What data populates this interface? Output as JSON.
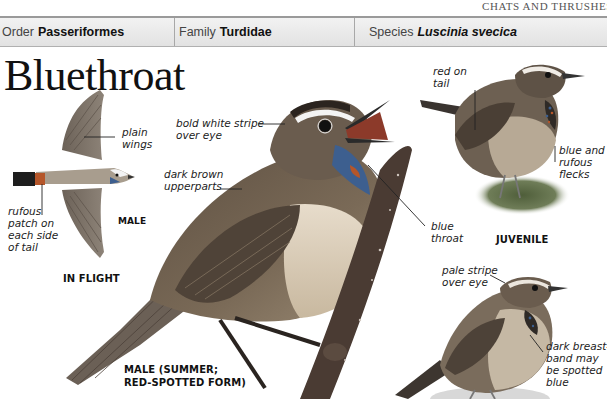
{
  "running_head": "Chats and Thrushes",
  "taxonomy": {
    "order": {
      "label": "Order",
      "value": "Passeriformes"
    },
    "family": {
      "label": "Family",
      "value": "Turdidae"
    },
    "species": {
      "label": "Species",
      "value": "Luscinia svecica"
    }
  },
  "title": "Bluethroat",
  "illustrations": {
    "in_flight": {
      "caption": "IN FLIGHT",
      "sex_label": "MALE",
      "notes": {
        "wings": "plain\nwings",
        "tail": "rufous\npatch on\neach side\nof tail"
      }
    },
    "male_summer": {
      "caption_line1": "MALE (SUMMER;",
      "caption_line2": "RED-SPOTTED FORM)",
      "notes": {
        "eye_line1": "bold white stripe",
        "eye_line2": "over eye",
        "upper_line1": "dark brown",
        "upper_line2": "upperparts",
        "throat_line1": "blue",
        "throat_line2": "throat"
      }
    },
    "juvenile": {
      "caption": "JUVENILE",
      "notes": {
        "tail_line1": "red on",
        "tail_line2": "tail",
        "flecks_line1": "blue and",
        "flecks_line2": "rufous",
        "flecks_line3": "flecks"
      }
    },
    "female": {
      "notes": {
        "eye_line1": "pale stripe",
        "eye_line2": "over eye",
        "breast_line1": "dark breast-",
        "breast_line2": "band may",
        "breast_line3": "be spotted",
        "breast_line4": "blue"
      }
    }
  },
  "colors": {
    "header_bar": "#e6e6e6",
    "header_border": "#9a9a9a",
    "bird_brown": "#6b5a48",
    "bird_belly": "#d9cbb4",
    "throat_blue": "#3d5f8f",
    "rufous": "#b5562a",
    "branch": "#4a3b33"
  }
}
